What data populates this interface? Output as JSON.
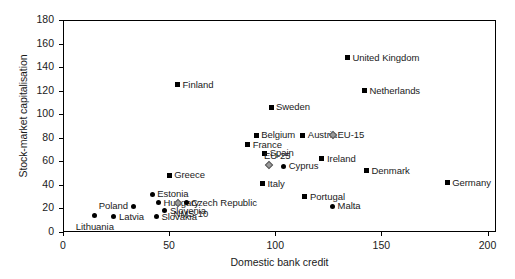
{
  "chart_data": {
    "type": "scatter",
    "title": "",
    "xlabel": "Domestic bank credit",
    "ylabel": "Stock-market capitalisation",
    "xlim": [
      0,
      204
    ],
    "ylim": [
      0,
      180
    ],
    "xticks": [
      0,
      50,
      100,
      150,
      200
    ],
    "yticks": [
      0,
      20,
      40,
      60,
      80,
      100,
      120,
      140,
      160,
      180
    ],
    "grid": false,
    "legend": "none",
    "points": [
      {
        "label": "United Kingdom",
        "x": 134,
        "y": 148,
        "marker": "square",
        "label_pos": "right"
      },
      {
        "label": "Netherlands",
        "x": 142,
        "y": 120,
        "marker": "square",
        "label_pos": "right"
      },
      {
        "label": "Finland",
        "x": 54,
        "y": 125,
        "marker": "square",
        "label_pos": "right"
      },
      {
        "label": "Sweden",
        "x": 98,
        "y": 106,
        "marker": "square",
        "label_pos": "right"
      },
      {
        "label": "Belgium",
        "x": 91,
        "y": 82,
        "marker": "square",
        "label_pos": "right"
      },
      {
        "label": "Austria",
        "x": 113,
        "y": 82,
        "marker": "square",
        "label_pos": "right"
      },
      {
        "label": "EU-15",
        "x": 127,
        "y": 82,
        "marker": "diamond",
        "label_pos": "right"
      },
      {
        "label": "France",
        "x": 87,
        "y": 74,
        "marker": "square",
        "label_pos": "right"
      },
      {
        "label": "Spain",
        "x": 95,
        "y": 67,
        "marker": "square",
        "label_pos": "right"
      },
      {
        "label": "EU-25",
        "x": 97,
        "y": 57,
        "marker": "diamond",
        "label_pos": "above"
      },
      {
        "label": "Cyprus",
        "x": 104,
        "y": 56,
        "marker": "circle",
        "label_pos": "right"
      },
      {
        "label": "Ireland",
        "x": 122,
        "y": 62,
        "marker": "square",
        "label_pos": "right"
      },
      {
        "label": "Denmark",
        "x": 143,
        "y": 52,
        "marker": "square",
        "label_pos": "right"
      },
      {
        "label": "Greece",
        "x": 50,
        "y": 48,
        "marker": "square",
        "label_pos": "right"
      },
      {
        "label": "Italy",
        "x": 94,
        "y": 41,
        "marker": "square",
        "label_pos": "right"
      },
      {
        "label": "Germany",
        "x": 181,
        "y": 42,
        "marker": "square",
        "label_pos": "right"
      },
      {
        "label": "Portugal",
        "x": 114,
        "y": 30,
        "marker": "square",
        "label_pos": "right"
      },
      {
        "label": "Malta",
        "x": 127,
        "y": 22,
        "marker": "circle",
        "label_pos": "right"
      },
      {
        "label": "Estonia",
        "x": 42,
        "y": 32,
        "marker": "circle",
        "label_pos": "right"
      },
      {
        "label": "Hungary",
        "x": 45,
        "y": 25,
        "marker": "circle",
        "label_pos": "right"
      },
      {
        "label": "Poland",
        "x": 33,
        "y": 22,
        "marker": "circle",
        "label_pos": "left"
      },
      {
        "label": "Czech Republic",
        "x": 58,
        "y": 25,
        "marker": "circle",
        "label_pos": "right"
      },
      {
        "label": "NMS-10",
        "x": 54,
        "y": 25,
        "marker": "diamond",
        "label_pos": "below"
      },
      {
        "label": "Slovenia",
        "x": 48,
        "y": 18,
        "marker": "circle",
        "label_pos": "right"
      },
      {
        "label": "Latvia",
        "x": 24,
        "y": 13,
        "marker": "circle",
        "label_pos": "right"
      },
      {
        "label": "Lithuania",
        "x": 15,
        "y": 14,
        "marker": "circle",
        "label_pos": "below-center"
      },
      {
        "label": "Slovakia",
        "x": 44,
        "y": 13,
        "marker": "circle",
        "label_pos": "right"
      }
    ]
  }
}
